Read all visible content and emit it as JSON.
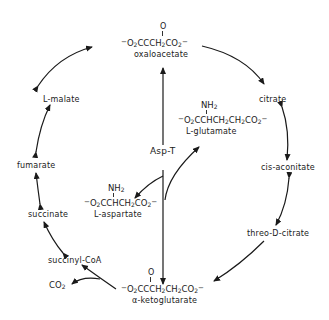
{
  "diagram": {
    "nodes": {
      "oxaloacetate": {
        "label": "oxaloacetate",
        "formula_parts": [
          "−O",
          "2",
          "CCCH",
          "2",
          "CO",
          "2",
          "−"
        ],
        "carbonyl": "O"
      },
      "citrate": {
        "label": "citrate"
      },
      "cis_aconitate": {
        "label": "cis-aconitate"
      },
      "threo_d_citrate": {
        "label": "threo-D-citrate"
      },
      "a_ketoglutarate": {
        "label": "α-ketoglutarate",
        "carbonyl": "O"
      },
      "succinyl_coa": {
        "label": "succinyl-CoA"
      },
      "co2": {
        "label": "CO",
        "sub": "2"
      },
      "succinate": {
        "label": "succinate"
      },
      "fumarate": {
        "label": "fumarate"
      },
      "l_malate": {
        "label": "L-malate"
      },
      "l_glutamate": {
        "label": "L-glutamate",
        "amine": "NH",
        "amine_sub": "2"
      },
      "l_aspartate": {
        "label": "L-aspartate",
        "amine": "NH",
        "amine_sub": "2"
      },
      "enzyme": {
        "label": "Asp-T"
      }
    },
    "colors": {
      "ink": "#1a1a1a",
      "background": "#ffffff"
    }
  }
}
